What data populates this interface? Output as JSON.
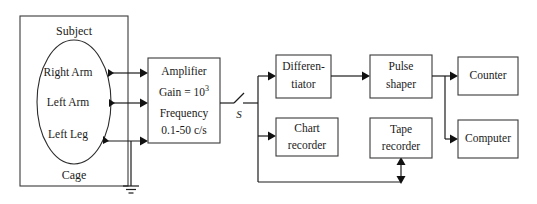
{
  "diagram": {
    "subject_enclosure": {
      "top_label": "Subject",
      "bottom_label": "Cage",
      "electrodes": [
        {
          "label": "Right Arm"
        },
        {
          "label": "Left Arm"
        },
        {
          "label": "Left Leg"
        }
      ]
    },
    "amplifier": {
      "line1": "Amplifier",
      "line2_prefix": "Gain = 10",
      "line2_exponent": "3",
      "line3": "Frequency",
      "line4": "0.1-50 c/s"
    },
    "switch": {
      "label": "S"
    },
    "blocks": [
      {
        "id": "differentiator",
        "line1": "Differen-",
        "line2": "tiator"
      },
      {
        "id": "pulse-shaper",
        "line1": "Pulse",
        "line2": "shaper"
      },
      {
        "id": "counter",
        "line1": "Counter",
        "line2": ""
      },
      {
        "id": "chart-recorder",
        "line1": "Chart",
        "line2": "recorder"
      },
      {
        "id": "tape-recorder",
        "line1": "Tape",
        "line2": "recorder"
      },
      {
        "id": "computer",
        "line1": "Computer",
        "line2": ""
      }
    ],
    "ground": {
      "name": "earth-ground-symbol"
    },
    "colors": {
      "background": "#ffffff",
      "box_stroke": "#3a3a3a",
      "wire": "#1c1c1c",
      "text": "#1a1a1a"
    }
  }
}
